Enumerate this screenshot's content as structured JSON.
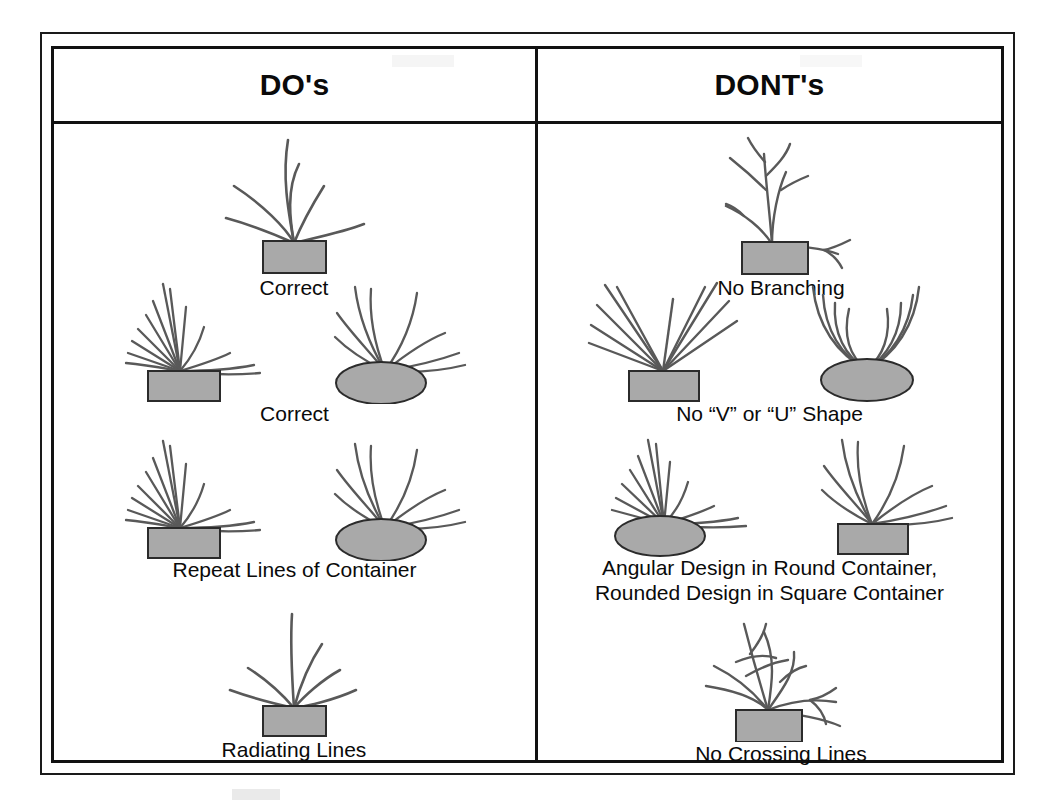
{
  "sheet": {
    "title_left": "DO's",
    "title_right": "DONT's"
  },
  "columns": [
    {
      "id": "dos",
      "header": "DO's",
      "items": [
        {
          "id": "do-1",
          "caption": "Correct",
          "containers": [
            "rectangle"
          ],
          "style": "radiating-curved-single"
        },
        {
          "id": "do-2",
          "caption": "Correct",
          "containers": [
            "rectangle",
            "ellipse"
          ],
          "style": "angular-fan-in-rect-rounded-fan-in-ellipse"
        },
        {
          "id": "do-3",
          "caption": "Repeat Lines of Container",
          "containers": [
            "rectangle",
            "ellipse"
          ],
          "style": "angular-fan-in-rect-rounded-fan-in-ellipse"
        },
        {
          "id": "do-4",
          "caption": "Radiating Lines",
          "containers": [
            "rectangle"
          ],
          "style": "radiating-curved-single"
        }
      ]
    },
    {
      "id": "donts",
      "header": "DONT's",
      "items": [
        {
          "id": "dont-1",
          "caption": "No Branching",
          "containers": [
            "rectangle"
          ],
          "style": "branching"
        },
        {
          "id": "dont-2",
          "caption": "No “V” or “U” Shape",
          "containers": [
            "rectangle",
            "ellipse"
          ],
          "style": "v-shape-and-u-shape"
        },
        {
          "id": "dont-3",
          "caption_line1": "Angular Design in Round Container,",
          "caption_line2": "Rounded Design in Square Container",
          "containers": [
            "ellipse",
            "rectangle"
          ],
          "style": "angular-in-round-rounded-in-square"
        },
        {
          "id": "dont-4",
          "caption": "No Crossing Lines",
          "containers": [
            "rectangle"
          ],
          "style": "crossing"
        }
      ]
    }
  ],
  "colors": {
    "container_fill": "#a9a9a9",
    "container_stroke": "#2b2b2b",
    "stem_stroke": "#595959",
    "border": "#111111",
    "text": "#0a0a0a",
    "background": "#ffffff"
  }
}
